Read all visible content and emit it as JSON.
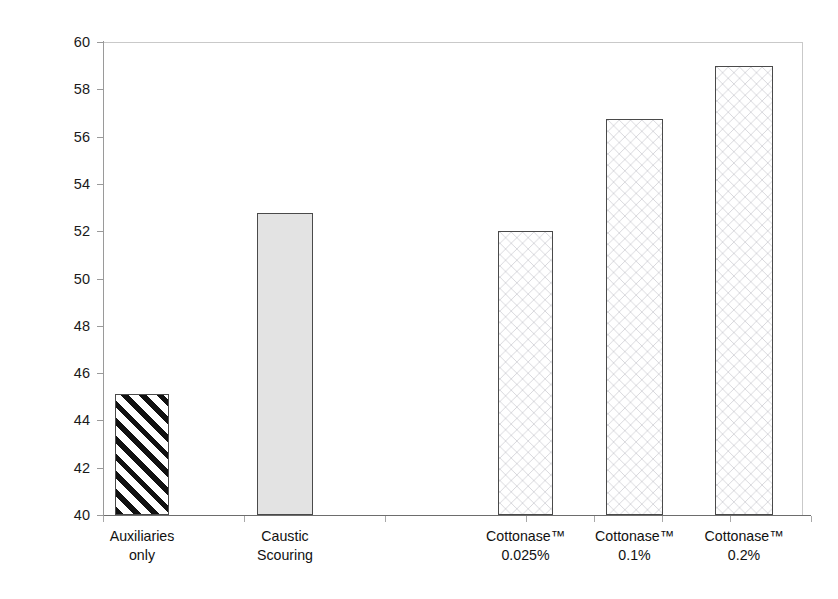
{
  "chart_data": {
    "type": "bar",
    "title": "",
    "subtitle": "",
    "xlabel": "",
    "ylabel": "Luminosity (%)",
    "ylim": [
      40,
      60
    ],
    "ytick_step": 2,
    "ytick_labels": [
      "60",
      "58",
      "56",
      "54",
      "52",
      "50",
      "48",
      "46",
      "44",
      "42",
      "40"
    ],
    "ytick_values": [
      60,
      58,
      56,
      54,
      52,
      50,
      48,
      46,
      44,
      42,
      40
    ],
    "grid": false,
    "legend": false,
    "legend_position": "none",
    "categories": [
      "Auxiliaries\nonly",
      "Caustic\nScouring",
      "Cottonase™\n0.025%",
      "Cottonase™\n0.1%",
      "Cottonase™\n0.2%"
    ],
    "values": [
      45.1,
      52.75,
      52.0,
      56.75,
      59.0
    ],
    "bar_fills": [
      "diagonal-hatch",
      "solid-grey",
      "chevron",
      "chevron",
      "chevron"
    ],
    "bar_edge_color": "#4a4a4a",
    "solid_grey_color": "#e3e3e3",
    "hatch_color": "#111111",
    "axis_color": "#9a9a9a",
    "background_color": "#ffffff"
  }
}
